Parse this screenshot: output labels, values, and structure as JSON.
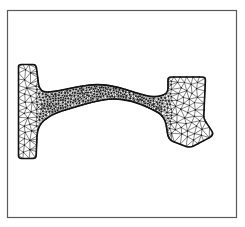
{
  "figure": {
    "kind": "finite-element-triangular-mesh",
    "title": "",
    "caption": "",
    "background_color": "#ffffff"
  },
  "frame": {
    "name": "figure-border",
    "x": 7.5,
    "y": 10.5,
    "width": 229,
    "height": 207,
    "stroke_color": "#5a5a5a",
    "stroke_width": 1.2,
    "fill": "none"
  },
  "mesh": {
    "outline_color": "#111111",
    "outline_width": 1.6,
    "edge_color": "#1a1a1a",
    "edge_width": 0.55,
    "fill_color": "#ffffff",
    "node_color": "#111111",
    "node_radius": 0.55,
    "region_names": [
      "left-flange",
      "left-fillet",
      "neck-band",
      "right-fillet",
      "right-block",
      "right-tab"
    ],
    "element_counts": {
      "left_flange": 188,
      "neck": 240,
      "right_block": 214
    },
    "outline_path": "M 18.5,66.5 L 18.5,155.5 Q 18.5,158.5 21.5,158.5 L 33.0,158.5 Q 36.0,158.5 36.2,155.5 L 37.0,136.0 Q 37.6,126.0 44.0,120.5 Q 52.0,114.0 62.0,111.0 Q 72.0,108.0 82.0,105.0 Q 93.0,101.7 103.0,100.0 Q 113.0,98.3 122.5,99.6 Q 132.0,100.9 141.0,104.4 Q 150.0,107.9 157.5,112.2 Q 164.0,116.0 166.0,124.0 L 167.6,134.0 Q 168.6,139.6 173.0,141.4 L 186.0,146.4 Q 190.0,147.9 193.6,146.0 L 209.5,137.6 Q 214.5,135.0 211.6,130.6 L 205.0,120.6 Q 203.6,118.4 203.8,115.6 L 205.4,80.2 Q 205.6,77.0 202.4,77.0 L 171.0,77.0 Q 168.0,77.0 168.0,80.0 L 168.0,88.0 Q 168.0,93.2 163.2,95.0 Q 155.0,98.0 146.0,95.6 Q 137.0,93.2 128.0,90.2 Q 118.0,86.9 108.0,85.4 Q 98.0,83.9 88.0,85.2 Q 78.0,86.5 68.0,88.8 Q 58.0,91.1 48.5,92.0 Q 40.0,92.8 38.6,84.4 L 36.4,67.6 Q 36.0,64.5 33.0,64.5 L 21.5,64.5 Q 18.5,64.5 18.5,66.5 Z"
  },
  "chart_data": {
    "type": "mesh",
    "xlabel": "",
    "ylabel": "",
    "xlim": [
      7.5,
      236.5
    ],
    "ylim": [
      10.5,
      217.5
    ],
    "grid": false,
    "legend": "none",
    "series": [
      {
        "name": "domain-boundary",
        "description": "Outer boundary of the meshed region"
      },
      {
        "name": "triangular-elements",
        "description": "Unstructured Delaunay triangulation, graded fine in the neck"
      }
    ],
    "annotations": []
  }
}
